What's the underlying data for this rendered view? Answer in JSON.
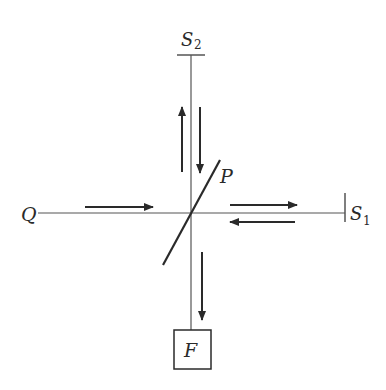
{
  "diagram": {
    "type": "Michelson interferometer schematic",
    "colors": {
      "line": "#555555",
      "arrow": "#2a2a2a",
      "background": "#ffffff"
    },
    "labels": {
      "source": "Q",
      "beam_splitter": "P",
      "mirror_1_letter": "S",
      "mirror_1_sub": "1",
      "mirror_2_letter": "S",
      "mirror_2_sub": "2",
      "detector": "F"
    },
    "elements": {
      "source_Q": {
        "x": 29,
        "y": 213
      },
      "beam_splitter_P": {
        "x1": 163,
        "y1": 265,
        "x2": 220,
        "y2": 160
      },
      "mirror_S1": {
        "x": 345,
        "y1": 193,
        "y2": 222
      },
      "mirror_S2": {
        "y": 55,
        "x1": 177,
        "x2": 205
      },
      "detector_F": {
        "x": 174,
        "y": 330,
        "w": 37,
        "h": 39
      }
    },
    "arrows": [
      {
        "name": "incoming-from-Q",
        "direction": "right"
      },
      {
        "name": "toward-S1",
        "direction": "right"
      },
      {
        "name": "return-from-S1",
        "direction": "left"
      },
      {
        "name": "toward-S2",
        "direction": "up"
      },
      {
        "name": "return-from-S2",
        "direction": "down"
      },
      {
        "name": "toward-F",
        "direction": "down"
      }
    ]
  }
}
